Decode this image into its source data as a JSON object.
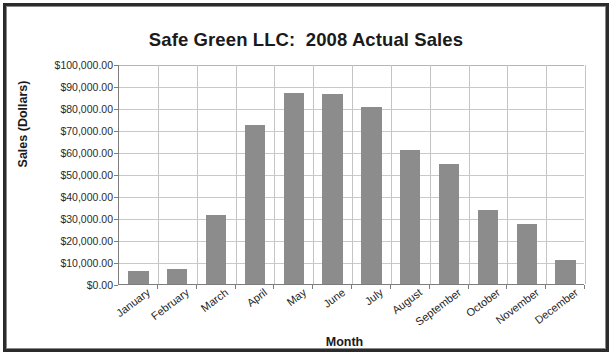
{
  "chart_data": {
    "type": "bar",
    "title": "Safe Green LLC:  2008 Actual Sales",
    "xlabel": "Month",
    "ylabel": "Sales (Dollars)",
    "categories": [
      "January",
      "February",
      "March",
      "April",
      "May",
      "June",
      "July",
      "August",
      "September",
      "October",
      "November",
      "December"
    ],
    "values": [
      6000,
      7000,
      31500,
      72500,
      87000,
      86500,
      80500,
      61000,
      54500,
      33500,
      27500,
      11000
    ],
    "ylim": [
      0,
      100000
    ],
    "ytick_step": 10000,
    "ytick_labels": [
      "$100,000.00",
      "$90,000.00",
      "$80,000.00",
      "$70,000.00",
      "$60,000.00",
      "$50,000.00",
      "$40,000.00",
      "$30,000.00",
      "$20,000.00",
      "$10,000.00",
      "$0.00"
    ],
    "ytick_values": [
      100000,
      90000,
      80000,
      70000,
      60000,
      50000,
      40000,
      30000,
      20000,
      10000,
      0
    ],
    "grid": {
      "horizontal": true,
      "vertical": true
    },
    "legend": {
      "visible": false,
      "position": "none"
    },
    "series": [
      {
        "name": "2008 Actual Sales",
        "color": "#8c8c8c",
        "values": [
          6000,
          7000,
          31500,
          72500,
          87000,
          86500,
          80500,
          61000,
          54500,
          33500,
          27500,
          11000
        ]
      }
    ]
  },
  "colors": {
    "bar": "#8c8c8c",
    "gridline": "#c9c9c9",
    "axis": "#7d7d7d",
    "frame": "#2b2b2b",
    "text": "#1a1a1a",
    "background": "#ffffff"
  }
}
